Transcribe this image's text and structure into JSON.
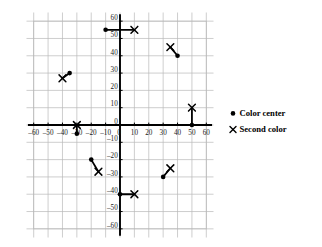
{
  "chart_data": {
    "type": "scatter",
    "title": "",
    "xlabel": "",
    "ylabel": "",
    "xlim": [
      -65,
      65
    ],
    "ylim": [
      -65,
      65
    ],
    "grid": true,
    "grid_spacing": 10,
    "xticks": [
      -60,
      -50,
      -40,
      -30,
      -20,
      -10,
      0,
      10,
      20,
      30,
      40,
      50,
      60
    ],
    "xtick_labels": [
      "–60",
      "–50",
      "–40",
      "–30",
      "–20",
      "–10",
      "0",
      "10",
      "20",
      "30",
      "40",
      "50",
      "60"
    ],
    "yticks": [
      60,
      50,
      40,
      30,
      20,
      10,
      0,
      -10,
      -20,
      -30,
      -40,
      -50,
      -60
    ],
    "ytick_labels": [
      "60",
      "50",
      "40",
      "30",
      "20",
      "10",
      "0",
      "–10",
      "–20",
      "–30",
      "–40",
      "–50",
      "–60"
    ],
    "legend_position": "right",
    "series": [
      {
        "name": "Color center",
        "marker": "dot",
        "points": [
          {
            "x": -10,
            "y": 55
          },
          {
            "x": 40,
            "y": 40
          },
          {
            "x": -35,
            "y": 30
          },
          {
            "x": -30,
            "y": -5
          },
          {
            "x": -20,
            "y": -20
          },
          {
            "x": 0,
            "y": -40
          },
          {
            "x": 30,
            "y": -30
          },
          {
            "x": 50,
            "y": 0
          }
        ]
      },
      {
        "name": "Second color",
        "marker": "cross",
        "points": [
          {
            "x": 10,
            "y": 55
          },
          {
            "x": 35,
            "y": 45
          },
          {
            "x": -40,
            "y": 27
          },
          {
            "x": -30,
            "y": 0
          },
          {
            "x": -15,
            "y": -27
          },
          {
            "x": 10,
            "y": -40
          },
          {
            "x": 35,
            "y": -25
          },
          {
            "x": 50,
            "y": 10
          }
        ]
      }
    ],
    "connections": [
      {
        "from": {
          "x": -10,
          "y": 55
        },
        "to": {
          "x": 10,
          "y": 55
        }
      },
      {
        "from": {
          "x": 40,
          "y": 40
        },
        "to": {
          "x": 35,
          "y": 45
        }
      },
      {
        "from": {
          "x": -35,
          "y": 30
        },
        "to": {
          "x": -40,
          "y": 27
        }
      },
      {
        "from": {
          "x": -30,
          "y": -5
        },
        "to": {
          "x": -30,
          "y": 0
        }
      },
      {
        "from": {
          "x": -20,
          "y": -20
        },
        "to": {
          "x": -15,
          "y": -27
        }
      },
      {
        "from": {
          "x": 0,
          "y": -40
        },
        "to": {
          "x": 10,
          "y": -40
        }
      },
      {
        "from": {
          "x": 30,
          "y": -30
        },
        "to": {
          "x": 35,
          "y": -25
        }
      },
      {
        "from": {
          "x": 50,
          "y": 0
        },
        "to": {
          "x": 50,
          "y": 10
        }
      }
    ]
  },
  "legend": {
    "items": [
      {
        "marker": "dot",
        "label": "Color center"
      },
      {
        "marker": "cross",
        "label": "Second color"
      }
    ]
  },
  "colors": {
    "axis": "#000000",
    "grid": "#b9b9b9",
    "marker": "#000000",
    "text": "#000000",
    "background": "#ffffff"
  }
}
